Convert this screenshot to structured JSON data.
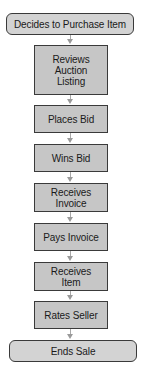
{
  "diagram": {
    "type": "flowchart",
    "nodes": [
      {
        "id": "start",
        "shape": "terminator",
        "label": "Decides to Purchase Item"
      },
      {
        "id": "reviews",
        "shape": "process",
        "label": "Reviews Auction Listing"
      },
      {
        "id": "places",
        "shape": "process",
        "label": "Places Bid"
      },
      {
        "id": "wins",
        "shape": "process",
        "label": "Wins Bid"
      },
      {
        "id": "receives-invoice",
        "shape": "process",
        "label": "Receives Invoice"
      },
      {
        "id": "pays",
        "shape": "process",
        "label": "Pays Invoice"
      },
      {
        "id": "receives-item",
        "shape": "process",
        "label": "Receives Item"
      },
      {
        "id": "rates",
        "shape": "process",
        "label": "Rates Seller"
      },
      {
        "id": "end",
        "shape": "terminator",
        "label": "Ends Sale"
      }
    ],
    "edges": [
      [
        "start",
        "reviews"
      ],
      [
        "reviews",
        "places"
      ],
      [
        "places",
        "wins"
      ],
      [
        "wins",
        "receives-invoice"
      ],
      [
        "receives-invoice",
        "pays"
      ],
      [
        "pays",
        "receives-item"
      ],
      [
        "receives-item",
        "rates"
      ],
      [
        "rates",
        "end"
      ]
    ],
    "colors": {
      "process_fill": "#c6c6c6",
      "terminator_fill": "#d3d3d3",
      "border": "#3a3a3a",
      "connector": "#a8a8a8"
    }
  }
}
